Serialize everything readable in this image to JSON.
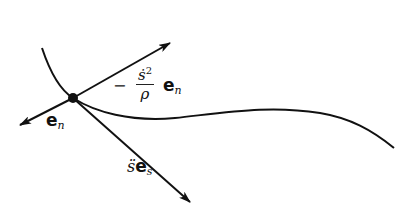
{
  "diagram": {
    "colors": {
      "stroke": "#111111",
      "background": "#ffffff"
    },
    "labels": {
      "unit_normal": {
        "main": "e",
        "sub": "n"
      },
      "normal_accel": {
        "sign": "−",
        "numerator": "ṡ",
        "exponent": "2",
        "denominator": "ρ",
        "vector": "e",
        "sub": "n"
      },
      "tangential_accel": {
        "scalar": "s̈",
        "vector": "e",
        "sub": "s"
      }
    },
    "elements": [
      "curve-path",
      "particle-point",
      "normal-accel-arrow",
      "unit-normal-arrow",
      "tangential-accel-arrow"
    ]
  }
}
